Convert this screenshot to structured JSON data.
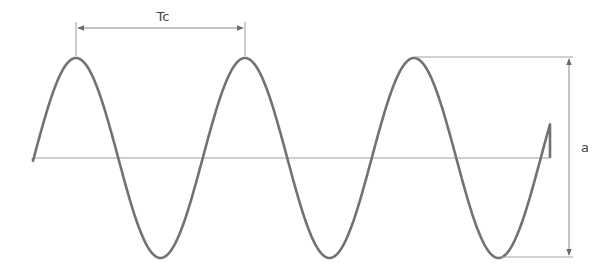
{
  "diagram": {
    "title": "",
    "labels": {
      "period": "Tc",
      "amplitude": "a"
    },
    "colors": {
      "wave": "#6e6e6e",
      "baseline": "#9a9a9a",
      "dimension": "#8a8a8a",
      "text": "#444444"
    },
    "wave": {
      "baseline_y": 158,
      "start_x": 33,
      "end_x": 550,
      "period_px": 169,
      "amplitude_px": 100,
      "first_peak_x": 76,
      "peaks_x": [
        76,
        245,
        415
      ],
      "troughs_x": [
        160,
        329,
        500
      ]
    }
  }
}
